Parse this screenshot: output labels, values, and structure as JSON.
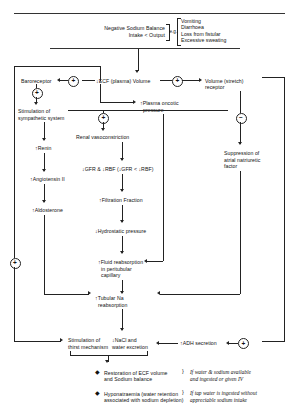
{
  "diagram": {
    "title_line1": "Negative Sodium Balance",
    "title_line2": "Intake < Output",
    "eg_label": "e.g.",
    "causes": [
      "Vomiting",
      "Diarrhoea",
      "Loss from fistular",
      "Excessive sweating"
    ],
    "nodes": {
      "baroreceptor": "Baroreceptor",
      "ecf_volume": "↓ECF (plasma) Volume",
      "stretch_receptor_l1": "Volume (stretch)",
      "stretch_receptor_l2": "receptor",
      "plasma_oncotic_l1": "↑Plasma oncotic",
      "plasma_oncotic_l2": "pressure",
      "sympathetic_l1": "Stimulation of",
      "sympathetic_l2": "sympathetic system",
      "renin": "↑Renin",
      "angiotensin": "↑Angiotensin II",
      "aldosterone": "↑Aldosterone",
      "renal_vasoconstriction": "Renal vasoconstriction",
      "gfr_rbf": "↓GFR & ↓RBF (↓GFR < ↓RBF)",
      "filtration_fraction": "↑Filtration Fraction",
      "hydrostatic_pressure": "↓Hydrostatic pressure",
      "fluid_reabs_l1": "↑Fluid reabsorption",
      "fluid_reabs_l2": "in peritubular",
      "fluid_reabs_l3": "capillary",
      "suppression_l1": "Suppression of",
      "suppression_l2": "atrial natriuretic",
      "suppression_l3": "factor",
      "tubular_na_l1": "↑Tubular Na",
      "tubular_na_l2": "reabsorption",
      "thirst_l1": "Stimulation of",
      "thirst_l2": "thirst mechanism",
      "nacl_l1": "↓NaCl and",
      "nacl_l2": "water excretion",
      "adh": "↑ADH secretion"
    },
    "signs": {
      "baroreceptor_in": "+",
      "sympathetic_in": "+",
      "stretch_in": "+",
      "stretch_out": "−",
      "renal_vaso_in": "+",
      "left_feedback": "+",
      "adh_in": "+"
    },
    "outcomes": [
      {
        "bullet": "◆",
        "text_l1": "Restoration of ECF volume",
        "text_l2": "and Sodium balance",
        "cond_l1": "If water & sodium available",
        "cond_l2": "and ingested or given IV"
      },
      {
        "bullet": "◆",
        "text_l1": "Hyponatraemia (water retention",
        "text_l2": "associated with sodium depletion)",
        "cond_l1": "If tap water is ingested without",
        "cond_l2": "appreciable sodium intake"
      }
    ],
    "colors": {
      "ink": "#111111",
      "rule": "#222222"
    }
  }
}
